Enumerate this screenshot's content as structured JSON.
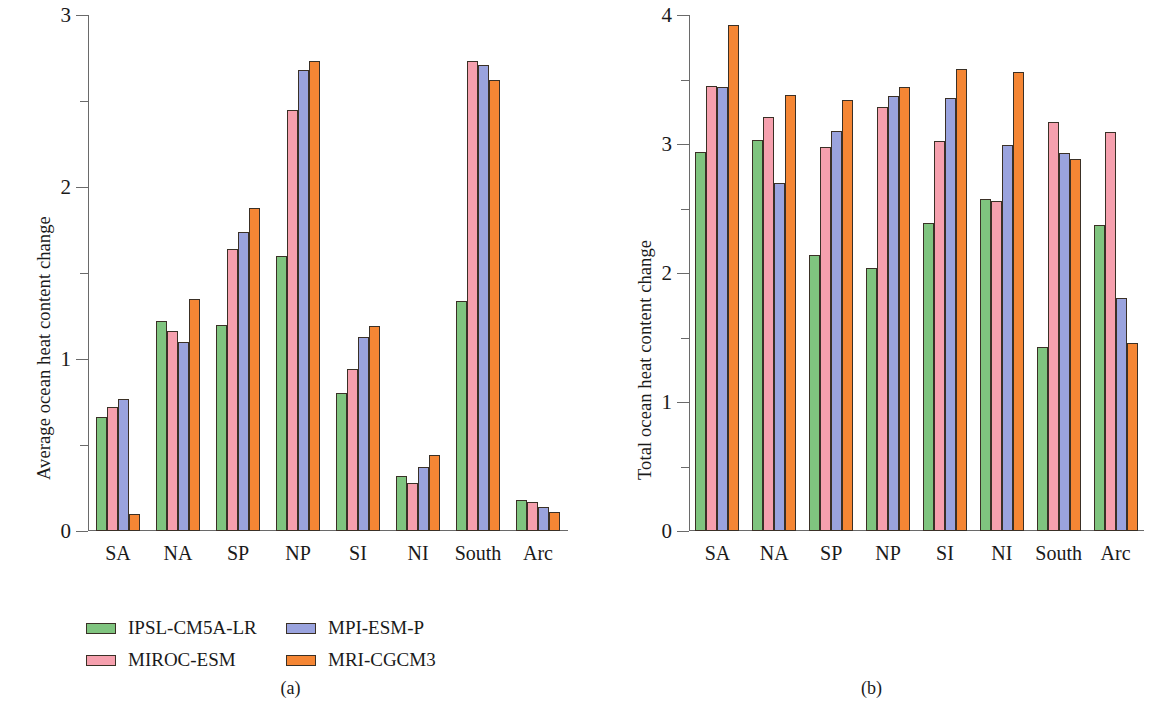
{
  "figure": {
    "panels": [
      {
        "caption": "(a)",
        "ylabel": "Average ocean heat content change",
        "chart_data": {
          "type": "bar",
          "title": "",
          "xlabel": "",
          "ylabel": "Average ocean heat content change",
          "ylim": [
            0,
            3
          ],
          "yticks_major": [
            "0",
            "1",
            "2",
            "3"
          ],
          "yticks_minor": [
            0.5,
            1.5,
            2.5
          ],
          "grid": false,
          "legend_position": "below",
          "categories": [
            "SA",
            "NA",
            "SP",
            "NP",
            "SI",
            "NI",
            "South",
            "Arc"
          ],
          "series": [
            {
              "name": "IPSL-CM5A-LR",
              "color": "#7fc47f",
              "values": [
                0.66,
                1.22,
                1.2,
                1.6,
                0.8,
                0.32,
                1.34,
                0.18
              ]
            },
            {
              "name": "MIROC-ESM",
              "color": "#f6a0ae",
              "values": [
                0.72,
                1.16,
                1.64,
                2.45,
                0.94,
                0.28,
                2.73,
                0.17
              ]
            },
            {
              "name": "MPI-ESM-P",
              "color": "#9aa3de",
              "values": [
                0.77,
                1.1,
                1.74,
                2.68,
                1.13,
                0.37,
                2.71,
                0.14
              ]
            },
            {
              "name": "MRI-CGCM3",
              "color": "#f58634",
              "values": [
                0.1,
                1.35,
                1.88,
                2.73,
                1.19,
                0.44,
                2.62,
                0.11
              ]
            }
          ]
        }
      },
      {
        "caption": "(b)",
        "ylabel": "Total ocean heat content change",
        "chart_data": {
          "type": "bar",
          "title": "",
          "xlabel": "",
          "ylabel": "Total ocean heat content change",
          "ylim": [
            0,
            4
          ],
          "yticks_major": [
            "0",
            "1",
            "2",
            "3",
            "4"
          ],
          "yticks_minor": [
            0.5,
            1.5,
            2.5,
            3.5
          ],
          "grid": false,
          "legend_position": "below",
          "categories": [
            "SA",
            "NA",
            "SP",
            "NP",
            "SI",
            "NI",
            "South",
            "Arc"
          ],
          "series": [
            {
              "name": "IPSL-CM5A-LR",
              "color": "#7fc47f",
              "values": [
                2.94,
                3.03,
                2.14,
                2.04,
                2.39,
                2.57,
                1.43,
                2.37
              ]
            },
            {
              "name": "MIROC-ESM",
              "color": "#f6a0ae",
              "values": [
                3.45,
                3.21,
                2.98,
                3.29,
                3.02,
                2.56,
                3.17,
                3.09
              ]
            },
            {
              "name": "MPI-ESM-P",
              "color": "#9aa3de",
              "values": [
                3.44,
                2.7,
                3.1,
                3.37,
                3.36,
                2.99,
                2.93,
                1.81
              ]
            },
            {
              "name": "MRI-CGCM3",
              "color": "#f58634",
              "values": [
                3.92,
                3.38,
                3.34,
                3.44,
                3.58,
                3.56,
                2.88,
                1.46
              ]
            }
          ]
        }
      }
    ],
    "legend": {
      "entries": [
        {
          "label": "IPSL-CM5A-LR",
          "color": "#7fc47f"
        },
        {
          "label": "MPI-ESM-P",
          "color": "#9aa3de"
        },
        {
          "label": "MIROC-ESM",
          "color": "#f6a0ae"
        },
        {
          "label": "MRI-CGCM3",
          "color": "#f58634"
        }
      ]
    }
  }
}
